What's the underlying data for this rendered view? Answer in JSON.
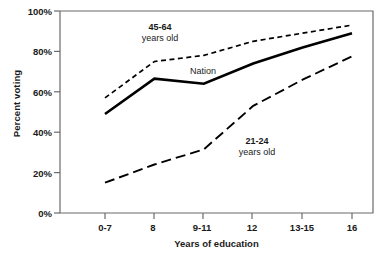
{
  "chart_data": {
    "type": "line",
    "title": "",
    "xlabel": "Years of education",
    "ylabel": "Percent voting",
    "categories": [
      "0-7",
      "8",
      "9-11",
      "12",
      "13-15",
      "16"
    ],
    "ylim": [
      0,
      100
    ],
    "yticks": [
      "0%",
      "20%",
      "40%",
      "60%",
      "80%",
      "100%"
    ],
    "ytick_values": [
      0,
      20,
      40,
      60,
      80,
      100
    ],
    "grid": false,
    "legend_position": "inline-annotations",
    "series": [
      {
        "name": "45-64 years old",
        "label_line1": "45-64",
        "label_line2": "years old",
        "style": "short-dashed",
        "values": [
          57,
          75,
          78,
          85,
          89,
          93
        ]
      },
      {
        "name": "Nation",
        "label_line1": "Nation",
        "label_line2": "",
        "style": "solid",
        "values": [
          49,
          66.5,
          64,
          74,
          82,
          89
        ]
      },
      {
        "name": "21-24 years old",
        "label_line1": "21-24",
        "label_line2": "years old",
        "style": "long-dashed",
        "values": [
          15,
          24,
          31.5,
          53,
          66,
          77.5
        ]
      }
    ]
  },
  "colors": {
    "line": "#000000",
    "axis": "#5a5a5a",
    "text": "#1a1a1a",
    "background": "#ffffff"
  }
}
